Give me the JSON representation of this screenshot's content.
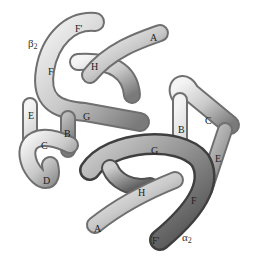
{
  "figure": {
    "chains": [
      {
        "id": "beta2",
        "greek": "β",
        "subscript": "2",
        "x": 28,
        "y": 38
      },
      {
        "id": "alpha2",
        "greek": "α",
        "subscript": "2",
        "x": 182,
        "y": 232
      }
    ],
    "helix_labels": [
      {
        "text": "F'",
        "x": 75,
        "y": 24,
        "chain": "beta2"
      },
      {
        "text": "A",
        "x": 150,
        "y": 33,
        "chain": "beta2"
      },
      {
        "text": "F",
        "x": 48,
        "y": 67,
        "chain": "beta2"
      },
      {
        "text": "H",
        "x": 91,
        "y": 62,
        "chain": "beta2"
      },
      {
        "text": "E",
        "x": 28,
        "y": 111,
        "chain": "beta2"
      },
      {
        "text": "G",
        "x": 83,
        "y": 112,
        "chain": "beta2"
      },
      {
        "text": "B",
        "x": 64,
        "y": 129,
        "chain": "beta2"
      },
      {
        "text": "C",
        "x": 41,
        "y": 141,
        "chain": "beta2"
      },
      {
        "text": "D",
        "x": 43,
        "y": 176,
        "chain": "beta2"
      },
      {
        "text": "C",
        "x": 205,
        "y": 116,
        "chain": "alpha2"
      },
      {
        "text": "B",
        "x": 178,
        "y": 125,
        "chain": "alpha2"
      },
      {
        "text": "G",
        "x": 151,
        "y": 146,
        "chain": "alpha2"
      },
      {
        "text": "E",
        "x": 215,
        "y": 154,
        "chain": "alpha2"
      },
      {
        "text": "H",
        "x": 138,
        "y": 188,
        "chain": "alpha2"
      },
      {
        "text": "F",
        "x": 191,
        "y": 196,
        "chain": "alpha2"
      },
      {
        "text": "A",
        "x": 94,
        "y": 224,
        "chain": "alpha2"
      },
      {
        "text": "F'",
        "x": 152,
        "y": 236,
        "chain": "alpha2"
      }
    ]
  }
}
